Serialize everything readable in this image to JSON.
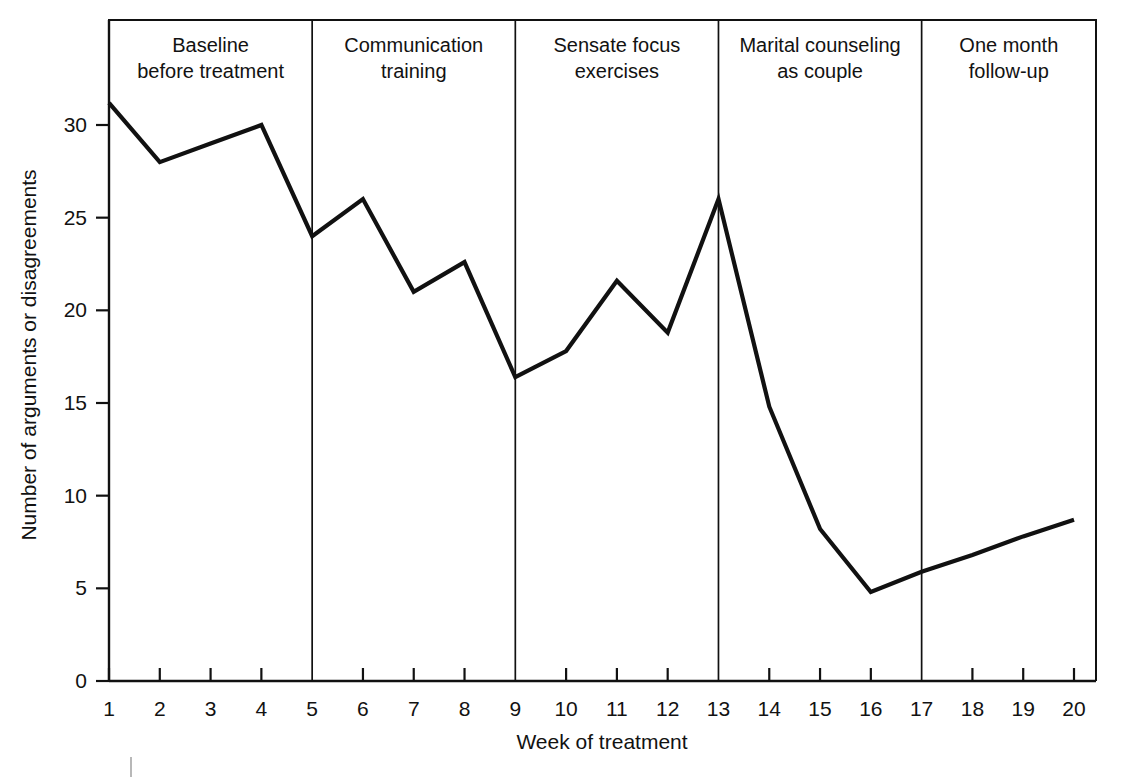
{
  "chart_data": {
    "type": "line",
    "title": "",
    "xlabel": "Week of treatment",
    "ylabel": "Number of arguments or disagreements",
    "x": [
      1,
      2,
      3,
      4,
      5,
      6,
      7,
      8,
      9,
      10,
      11,
      12,
      13,
      14,
      15,
      16,
      17,
      18,
      19,
      20
    ],
    "values": [
      31.2,
      28.0,
      29.0,
      30.0,
      24.0,
      26.0,
      21.0,
      22.6,
      16.4,
      17.8,
      21.6,
      18.8,
      26.0,
      14.8,
      8.2,
      4.8,
      5.9,
      6.8,
      7.8,
      8.7
    ],
    "xlim": [
      1,
      20
    ],
    "ylim": [
      0,
      32
    ],
    "xticks": [
      "1",
      "2",
      "3",
      "4",
      "5",
      "6",
      "7",
      "8",
      "9",
      "10",
      "11",
      "12",
      "13",
      "14",
      "15",
      "16",
      "17",
      "18",
      "19",
      "20"
    ],
    "yticks": [
      "0",
      "5",
      "10",
      "15",
      "20",
      "25",
      "30"
    ],
    "ytick_values": [
      0,
      5,
      10,
      15,
      20,
      25,
      30
    ],
    "grid": false,
    "legend": "none",
    "line_color": "#111111",
    "background_color": "#ffffff",
    "phases": [
      {
        "label_line1": "Baseline",
        "label_line2": "before treatment",
        "start_week": 1,
        "end_week": 5
      },
      {
        "label_line1": "Communication",
        "label_line2": "training",
        "start_week": 5,
        "end_week": 9
      },
      {
        "label_line1": "Sensate focus",
        "label_line2": "exercises",
        "start_week": 9,
        "end_week": 13
      },
      {
        "label_line1": "Marital counseling",
        "label_line2": "as couple",
        "start_week": 13,
        "end_week": 17
      },
      {
        "label_line1": "One month",
        "label_line2": "follow-up",
        "start_week": 17,
        "end_week": 20
      }
    ]
  }
}
